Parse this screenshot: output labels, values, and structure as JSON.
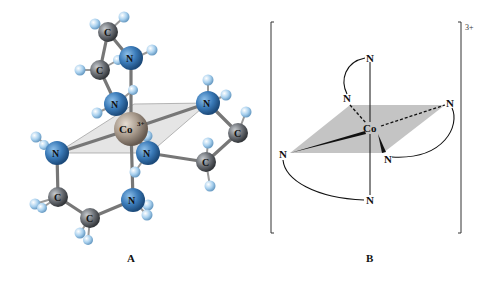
{
  "figure": {
    "panel_a": {
      "label": "A",
      "metal": {
        "symbol": "Co",
        "charge": "3+"
      },
      "nitrogen_label": "N",
      "carbon_label": "C",
      "colors": {
        "cobalt": "#a89a8c",
        "nitrogen": "#3a7ab8",
        "carbon": "#6e7278",
        "hydrogen": "#a8d0ee",
        "bond": "#7a7a7a",
        "plane": "#dcdcdc"
      }
    },
    "panel_b": {
      "label": "B",
      "metal": "Co",
      "ligand_atoms": [
        "N",
        "N",
        "N",
        "N",
        "N",
        "N"
      ],
      "charge": "3+",
      "colors": {
        "plane": "#c4c4c4",
        "line": "#111111"
      }
    }
  }
}
